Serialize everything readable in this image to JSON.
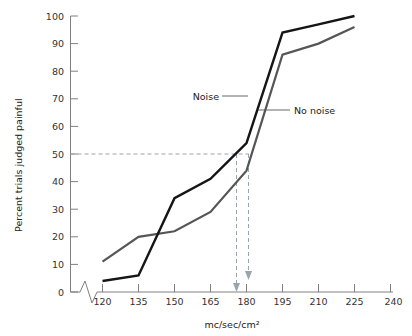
{
  "chart_data": {
    "type": "line",
    "title": "",
    "xlabel": "mc/sec/cm2",
    "xlabel_display": "mc/sec/cm²",
    "ylabel": "Percent trials judged painful",
    "xlim": [
      112,
      240
    ],
    "ylim": [
      0,
      100
    ],
    "xticks": [
      120,
      135,
      150,
      165,
      180,
      195,
      210,
      225,
      240
    ],
    "yticks": [
      0,
      10,
      20,
      30,
      40,
      50,
      60,
      70,
      80,
      90,
      100
    ],
    "grid": false,
    "legend_position": "inline-annotations",
    "axis_break_x": true,
    "x": [
      120,
      135,
      150,
      165,
      180,
      195,
      210,
      225
    ],
    "series": [
      {
        "name": "Noise",
        "color": "#151515",
        "values": [
          4,
          6,
          34,
          41,
          54,
          94,
          97,
          100
        ]
      },
      {
        "name": "No noise",
        "color": "#565656",
        "values": [
          11,
          20,
          22,
          29,
          44,
          86,
          90,
          96
        ]
      }
    ],
    "annotations": [
      {
        "name": "threshold-line",
        "type": "horizontal-dashed",
        "y": 50
      },
      {
        "name": "noise-threshold-arrow",
        "type": "vertical-dashed-arrow",
        "x": 173,
        "from_y": 50,
        "to_y": 0
      },
      {
        "name": "no-noise-threshold-arrow",
        "type": "vertical-dashed-arrow",
        "x": 180,
        "from_y": 50,
        "to_y": 0
      }
    ],
    "series_labels": [
      {
        "name": "Noise",
        "text": "Noise"
      },
      {
        "name": "No noise",
        "text": "No noise"
      }
    ]
  },
  "labels": {
    "y_axis_title": "Percent trials judged painful",
    "x_axis_title": "mc/sec/cm²",
    "series_noise": "Noise",
    "series_nonoise": "No noise",
    "ytick_0": "0",
    "ytick_10": "10",
    "ytick_20": "20",
    "ytick_30": "30",
    "ytick_40": "40",
    "ytick_50": "50",
    "ytick_60": "60",
    "ytick_70": "70",
    "ytick_80": "80",
    "ytick_90": "90",
    "ytick_100": "100",
    "xtick_120": "120",
    "xtick_135": "135",
    "xtick_150": "150",
    "xtick_165": "165",
    "xtick_180": "180",
    "xtick_195": "195",
    "xtick_210": "210",
    "xtick_225": "225",
    "xtick_240": "240"
  },
  "colors": {
    "noise": "#151515",
    "nonoise": "#565656",
    "axis": "#808080",
    "guide": "#9aa4ab",
    "background": "#ffffff"
  }
}
